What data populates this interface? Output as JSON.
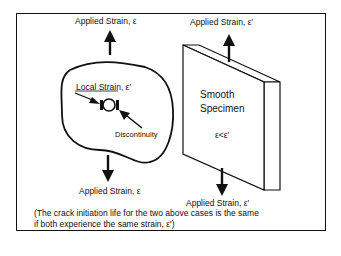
{
  "diagram": {
    "left_case": {
      "top_label": "Applied Strain,  ε",
      "bottom_label": "Applied Strain,  ε",
      "local_label": "Local Strain,  ε′",
      "feature_label": "Discontinuity"
    },
    "right_case": {
      "top_label": "Applied Strain,  ε′",
      "bottom_label": "Applied Strain,  ε′",
      "specimen_line1": "Smooth",
      "specimen_line2": "Specimen",
      "relation": "ε<ε′"
    },
    "note_line1": "(The crack initiation life for the two above cases is the same",
    "note_line2": "if both experience the same strain, ε′)"
  }
}
